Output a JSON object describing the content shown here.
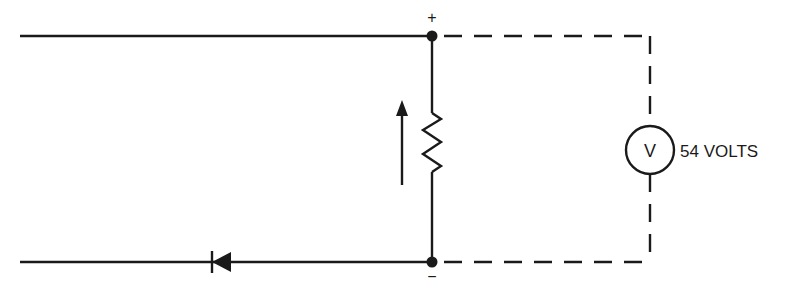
{
  "diagram": {
    "type": "circuit",
    "terminals": {
      "positive": "+",
      "negative": "−"
    },
    "meter": {
      "symbol": "V",
      "reading": "54 VOLTS"
    },
    "components": [
      "top-wire",
      "bottom-wire",
      "resistor",
      "current-arrow",
      "diode",
      "voltmeter",
      "dashed-meter-leads"
    ],
    "colors": {
      "ink": "#1a1a1a",
      "background": "#ffffff"
    }
  }
}
